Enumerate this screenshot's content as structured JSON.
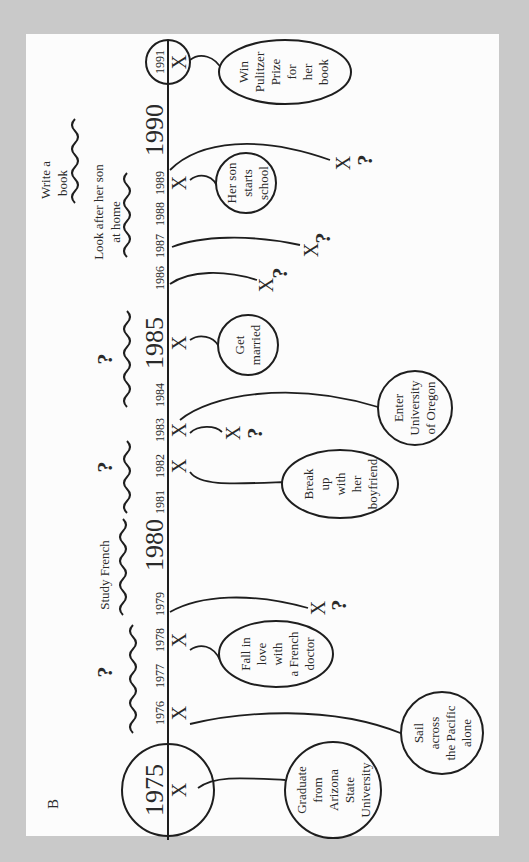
{
  "figure_label": "B",
  "colors": {
    "background": "#c9c9c9",
    "paper": "#fcfcfc",
    "ink": "#1e1e1e"
  },
  "timeline": {
    "orientation": "rotated-90-ccw",
    "years": [
      {
        "year": "1975",
        "style": "big-circled",
        "y": 790
      },
      {
        "year": "1976",
        "style": "small",
        "y": 713
      },
      {
        "year": "1977",
        "style": "small",
        "y": 676
      },
      {
        "year": "1978",
        "style": "small",
        "y": 640
      },
      {
        "year": "1979",
        "style": "small",
        "y": 604
      },
      {
        "year": "1980",
        "style": "big",
        "y": 545
      },
      {
        "year": "1981",
        "style": "small",
        "y": 502
      },
      {
        "year": "1982",
        "style": "small",
        "y": 466
      },
      {
        "year": "1983",
        "style": "small",
        "y": 430
      },
      {
        "year": "1984",
        "style": "small",
        "y": 395
      },
      {
        "year": "1985",
        "style": "big",
        "y": 343
      },
      {
        "year": "1986",
        "style": "small",
        "y": 278
      },
      {
        "year": "1987",
        "style": "small",
        "y": 246
      },
      {
        "year": "1988",
        "style": "small",
        "y": 214
      },
      {
        "year": "1989",
        "style": "small",
        "y": 183
      },
      {
        "year": "1990",
        "style": "big",
        "y": 130
      },
      {
        "year": "1991",
        "style": "small-circled",
        "y": 62
      }
    ]
  },
  "events": [
    {
      "year": "1975",
      "label": "Graduate from Arizona State University",
      "lines": [
        "Graduate",
        "from",
        "Arizona",
        "State",
        "University"
      ],
      "happened": true
    },
    {
      "year": "1976",
      "label": "Sail across the Pacific alone",
      "lines": [
        "Sail",
        "across",
        "the Pacific",
        "alone"
      ],
      "happened": true
    },
    {
      "year": "1978",
      "label": "Fall in love with a French doctor",
      "lines": [
        "Fall in",
        "love",
        "with",
        "a French",
        "doctor"
      ],
      "happened": true
    },
    {
      "year": "1982",
      "label": "Break up with her boyfriend",
      "lines": [
        "Break",
        "up",
        "with",
        "her",
        "boyfriend"
      ],
      "happened": true
    },
    {
      "year": "1983",
      "label": "Enter University of Oregon",
      "lines": [
        "Enter",
        "University",
        "of Oregon"
      ],
      "happened": true
    },
    {
      "year": "1985",
      "label": "Get married",
      "lines": [
        "Get",
        "married"
      ],
      "happened": true
    },
    {
      "year": "1989",
      "label": "Her son starts school",
      "lines": [
        "Her son",
        "starts",
        "school"
      ],
      "happened": true
    },
    {
      "year": "1991",
      "label": "Win Pulitzer Prize for her book",
      "lines": [
        "Win",
        "Pulitzer",
        "Prize",
        "for",
        "her",
        "book"
      ],
      "happened": true
    }
  ],
  "unknown_events": [
    {
      "from_year": "1979",
      "mark": "X",
      "question": "?"
    },
    {
      "from_year": "1983",
      "mark": "X",
      "question": "?"
    },
    {
      "from_year": "1986",
      "mark": "X",
      "question": "?"
    },
    {
      "from_year": "1987",
      "mark": "X",
      "question": "?"
    },
    {
      "from_year": "1989",
      "mark": "X",
      "question": "?"
    }
  ],
  "periods": [
    {
      "span": "1976–1979",
      "label": "",
      "question": "?"
    },
    {
      "span": "1979–1981",
      "label": "Study French",
      "question": ""
    },
    {
      "span": "1981–1983",
      "label": "",
      "question": "?"
    },
    {
      "span": "1984–1986",
      "label": "",
      "question": "?"
    },
    {
      "span": "1986–1989",
      "label": "Look after her son at home",
      "lines": [
        "Look after her son",
        "at home"
      ],
      "question": ""
    },
    {
      "span": "1989–1990",
      "label": "Write a book",
      "lines": [
        "Write a",
        "book"
      ],
      "question": ""
    }
  ],
  "marks": {
    "x": "X",
    "q": "?"
  }
}
